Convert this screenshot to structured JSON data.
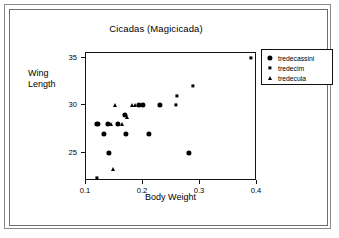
{
  "chart_data": {
    "type": "scatter",
    "title": "Cicadas (Magicicada)",
    "xlabel": "Body Weight",
    "ylabel_lines": [
      "Wing",
      "Length"
    ],
    "ylabel": "Wing Length",
    "xlim": [
      0.1,
      0.4
    ],
    "ylim": [
      22.0,
      35.5
    ],
    "xticks": [
      0.1,
      0.2,
      0.3,
      0.4
    ],
    "xticklabels": [
      "0.1",
      "0.2",
      "0.3",
      "0.4"
    ],
    "yticks": [
      25,
      30,
      35
    ],
    "yticklabels": [
      "25",
      "30",
      "35"
    ],
    "grid": false,
    "legend_position": "right",
    "series": [
      {
        "name": "tredecassini",
        "marker": "filled-circle",
        "color": "#000000",
        "points": [
          {
            "x": 0.12,
            "y": 28.0
          },
          {
            "x": 0.131,
            "y": 27.0
          },
          {
            "x": 0.138,
            "y": 28.0
          },
          {
            "x": 0.14,
            "y": 25.0
          },
          {
            "x": 0.156,
            "y": 28.0
          },
          {
            "x": 0.168,
            "y": 29.0
          },
          {
            "x": 0.17,
            "y": 27.0
          },
          {
            "x": 0.193,
            "y": 30.0
          },
          {
            "x": 0.2,
            "y": 30.0
          },
          {
            "x": 0.21,
            "y": 27.0
          },
          {
            "x": 0.23,
            "y": 30.0
          },
          {
            "x": 0.281,
            "y": 25.0
          }
        ]
      },
      {
        "name": "tredecim",
        "marker": "small-square",
        "color": "#000000",
        "points": [
          {
            "x": 0.119,
            "y": 22.3
          },
          {
            "x": 0.258,
            "y": 30.0
          },
          {
            "x": 0.259,
            "y": 31.0
          },
          {
            "x": 0.288,
            "y": 32.0
          },
          {
            "x": 0.39,
            "y": 35.0
          }
        ]
      },
      {
        "name": "tredecula",
        "marker": "small-triangle",
        "color": "#000000",
        "points": [
          {
            "x": 0.143,
            "y": 28.0
          },
          {
            "x": 0.148,
            "y": 23.3
          },
          {
            "x": 0.151,
            "y": 30.0
          },
          {
            "x": 0.163,
            "y": 28.0
          },
          {
            "x": 0.172,
            "y": 28.8
          },
          {
            "x": 0.181,
            "y": 30.0
          },
          {
            "x": 0.186,
            "y": 30.0
          }
        ]
      }
    ]
  },
  "legend": {
    "entries": [
      {
        "label": "tredecassini",
        "marker": "filled-circle"
      },
      {
        "label": "tredecim",
        "marker": "small-square"
      },
      {
        "label": "tredecula",
        "marker": "small-triangle"
      }
    ]
  }
}
